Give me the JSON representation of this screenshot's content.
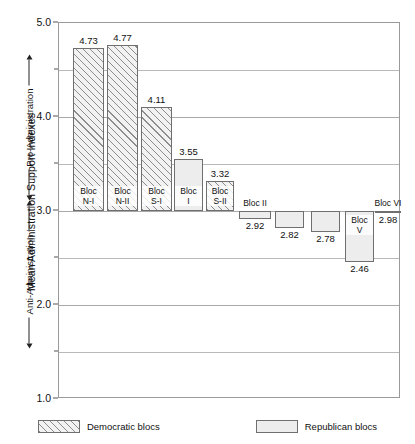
{
  "chart_data": {
    "type": "bar",
    "title": "",
    "xlabel": "",
    "ylabel": "Mean Administration Support Indexes",
    "ylim": [
      1.0,
      5.0
    ],
    "baseline": 3.0,
    "grid": true,
    "legend_position": "bottom",
    "ytick_labels": [
      "5.0",
      "4.0",
      "3.0",
      "2.0",
      "1.0"
    ],
    "ytick_values": [
      5.0,
      4.0,
      3.0,
      2.0,
      1.0
    ],
    "minor_gridlines": [
      4.5,
      3.5,
      2.5,
      1.5
    ],
    "axis_annotation": {
      "pro": "Pro-Administration",
      "anti": "Anti-Administration"
    },
    "categories": [
      "Bloc N-I",
      "Bloc N-II",
      "Bloc S-I",
      "Bloc I",
      "Bloc S-II",
      "Bloc II",
      "Bloc III",
      "Bloc IV",
      "Bloc V",
      "Bloc VI"
    ],
    "values": [
      4.73,
      4.77,
      4.11,
      3.55,
      3.32,
      2.92,
      2.82,
      2.78,
      2.46,
      2.98
    ],
    "series": [
      {
        "name": "Democratic blocs",
        "values": [
          4.73,
          4.77,
          4.11,
          null,
          3.32,
          null,
          null,
          null,
          null,
          null
        ]
      },
      {
        "name": "Republican blocs",
        "values": [
          null,
          null,
          null,
          3.55,
          null,
          2.92,
          2.82,
          2.78,
          2.46,
          2.98
        ]
      }
    ],
    "bars": [
      {
        "label_line1": "Bloc",
        "label_line2": "N-I",
        "label_full": "Bloc N-I",
        "value": 4.73,
        "value_text": "4.73",
        "party": "dem",
        "label_placement": "inside",
        "x": 72,
        "w": 31
      },
      {
        "label_line1": "Bloc",
        "label_line2": "N-II",
        "label_full": "Bloc N-II",
        "value": 4.77,
        "value_text": "4.77",
        "party": "dem",
        "label_placement": "inside",
        "x": 106,
        "w": 31
      },
      {
        "label_line1": "Bloc",
        "label_line2": "S-I",
        "label_full": "Bloc S-I",
        "value": 4.11,
        "value_text": "4.11",
        "party": "dem",
        "label_placement": "inside",
        "x": 140,
        "w": 31
      },
      {
        "label_line1": "Bloc",
        "label_line2": "I",
        "label_full": "Bloc I",
        "value": 3.55,
        "value_text": "3.55",
        "party": "rep",
        "label_placement": "inside",
        "x": 173,
        "w": 29
      },
      {
        "label_line1": "Bloc",
        "label_line2": "S-II",
        "label_full": "Bloc S-II",
        "value": 3.32,
        "value_text": "3.32",
        "party": "dem",
        "label_placement": "inside",
        "x": 205,
        "w": 28
      },
      {
        "label_line1": "Bloc II",
        "label_line2": "",
        "label_full": "Bloc II",
        "value": 2.92,
        "value_text": "2.92",
        "party": "rep",
        "label_placement": "above",
        "x": 238,
        "w": 32
      },
      {
        "label_line1": "Bloc",
        "label_line2": "III",
        "label_full": "Bloc III",
        "value": 2.82,
        "value_text": "2.82",
        "party": "rep",
        "label_placement": "inside",
        "x": 274,
        "w": 29
      },
      {
        "label_line1": "Bloc",
        "label_line2": "IV",
        "label_full": "Bloc IV",
        "value": 2.78,
        "value_text": "2.78",
        "party": "rep",
        "label_placement": "inside",
        "x": 310,
        "w": 29
      },
      {
        "label_line1": "Bloc",
        "label_line2": "V",
        "label_full": "Bloc V",
        "value": 2.46,
        "value_text": "2.46",
        "party": "rep",
        "label_placement": "inside",
        "x": 344,
        "w": 29
      },
      {
        "label_line1": "Bloc VI",
        "label_line2": "",
        "label_full": "Bloc VI",
        "value": 2.98,
        "value_text": "2.98",
        "party": "rep",
        "label_placement": "above",
        "x": 374,
        "w": 26
      }
    ],
    "legend": [
      {
        "label": "Democratic blocs",
        "pattern": "diagonal-hatch",
        "party": "dem"
      },
      {
        "label": "Republican blocs",
        "pattern": "dotted-stipple",
        "party": "rep"
      }
    ]
  }
}
